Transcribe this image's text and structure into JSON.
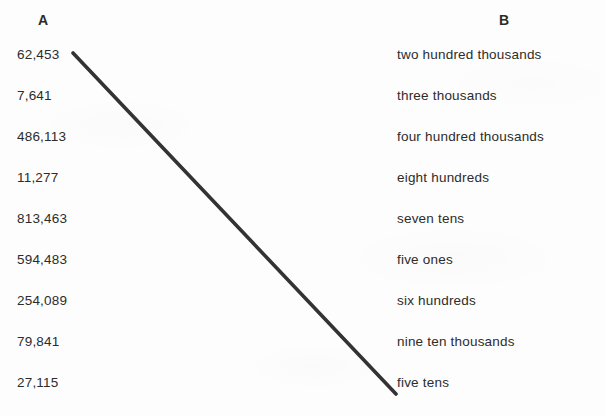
{
  "worksheet": {
    "headers": {
      "column_a": "A",
      "column_b": "B"
    },
    "column_a": [
      {
        "label": "62,453"
      },
      {
        "label": "7,641"
      },
      {
        "label": "486,113"
      },
      {
        "label": "11,277"
      },
      {
        "label": "813,463"
      },
      {
        "label": "594,483"
      },
      {
        "label": "254,089"
      },
      {
        "label": "79,841"
      },
      {
        "label": "27,115"
      }
    ],
    "column_b": [
      {
        "label": "two hundred thousands"
      },
      {
        "label": "three thousands"
      },
      {
        "label": "four hundred thousands"
      },
      {
        "label": "eight hundreds"
      },
      {
        "label": "seven tens"
      },
      {
        "label": "five ones"
      },
      {
        "label": "six hundreds"
      },
      {
        "label": "nine ten thousands"
      },
      {
        "label": "five tens"
      }
    ],
    "matching_lines": [
      {
        "name": "line-62453-to-five-tens",
        "from_item": "62,453",
        "to_item": "five tens",
        "x1": 73,
        "y1": 53,
        "x2": 396,
        "y2": 394,
        "color": "#333333",
        "width": 3.6
      }
    ],
    "colors": {
      "background": "#fdfdfd",
      "text": "#2c2c2c",
      "header_text": "#2b2b2b",
      "line": "#333333"
    }
  }
}
